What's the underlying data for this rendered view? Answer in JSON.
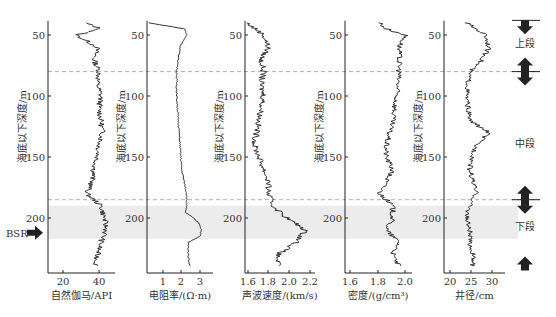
{
  "chart_data": {
    "type": "line",
    "title": "",
    "ylabel": "海底以下深度/m",
    "yticks": [
      50,
      100,
      150,
      200
    ],
    "ylim": [
      40,
      245
    ],
    "dashed_lines_depth": [
      80,
      185
    ],
    "shaded_band_depth": [
      190,
      217
    ],
    "bsr_label": "BSR",
    "bsr_depth": 212,
    "panels": [
      {
        "name": "自然伽马",
        "xlabel": "自然伽马/API",
        "xticks": [
          "20",
          "40"
        ],
        "xlim": [
          12,
          50
        ],
        "depth": [
          40,
          45,
          50,
          60,
          70,
          80,
          90,
          100,
          110,
          120,
          130,
          140,
          150,
          160,
          170,
          180,
          190,
          200,
          210,
          220,
          230,
          240
        ],
        "values": [
          33,
          42,
          28,
          40,
          38,
          41,
          40,
          42,
          41,
          42,
          43,
          41,
          40,
          38,
          37,
          34,
          42,
          44,
          45,
          42,
          40,
          39
        ]
      },
      {
        "name": "电阻率",
        "xlabel": "电阻率/(Ω·m)",
        "xticks": [
          "1",
          "2",
          "3"
        ],
        "xlim": [
          0,
          4
        ],
        "depth": [
          40,
          45,
          50,
          60,
          70,
          80,
          100,
          120,
          140,
          160,
          180,
          190,
          195,
          200,
          205,
          210,
          215,
          220,
          230,
          240
        ],
        "values": [
          0.1,
          2.3,
          2.4,
          2.0,
          1.9,
          1.8,
          1.8,
          1.9,
          2.0,
          2.1,
          2.4,
          2.4,
          2.3,
          2.8,
          3.2,
          3.3,
          3.2,
          2.5,
          2.5,
          2.6
        ]
      },
      {
        "name": "声波速度",
        "xlabel": "声波速度/(km/s)",
        "xticks": [
          "1.6",
          "1.8",
          "2.0",
          "2.2"
        ],
        "xlim": [
          1.55,
          2.3
        ],
        "depth": [
          40,
          50,
          60,
          70,
          80,
          90,
          100,
          120,
          140,
          150,
          160,
          170,
          180,
          190,
          200,
          210,
          220,
          230,
          240
        ],
        "values": [
          1.57,
          1.75,
          1.8,
          1.72,
          1.75,
          1.72,
          1.75,
          1.7,
          1.65,
          1.7,
          1.75,
          1.8,
          1.8,
          1.85,
          2.0,
          2.2,
          2.1,
          1.9,
          1.9
        ]
      },
      {
        "name": "密度",
        "xlabel": "密度/(g/cm³)",
        "xticks": [
          "1.6",
          "1.8",
          "2.0"
        ],
        "xlim": [
          1.58,
          2.1
        ],
        "depth": [
          40,
          45,
          50,
          60,
          80,
          100,
          120,
          140,
          150,
          160,
          170,
          180,
          190,
          200,
          210,
          220,
          230,
          240
        ],
        "values": [
          1.85,
          1.9,
          2.05,
          2.0,
          2.0,
          1.98,
          1.95,
          1.9,
          1.9,
          1.95,
          1.9,
          1.85,
          1.95,
          1.95,
          1.9,
          2.0,
          1.95,
          2.0
        ]
      },
      {
        "name": "井径",
        "xlabel": "井径/cm",
        "xticks": [
          "20",
          "25",
          "30"
        ],
        "xlim": [
          18,
          37
        ],
        "depth": [
          40,
          50,
          60,
          70,
          80,
          100,
          120,
          130,
          140,
          150,
          160,
          170,
          180,
          190,
          200,
          210,
          220,
          230,
          240
        ],
        "values": [
          25,
          31,
          32,
          30,
          26,
          25,
          26,
          32,
          28,
          27,
          26,
          27,
          28,
          26,
          25,
          26,
          26,
          27,
          27
        ]
      }
    ],
    "zones": [
      "上段",
      "中段",
      "下段"
    ]
  }
}
